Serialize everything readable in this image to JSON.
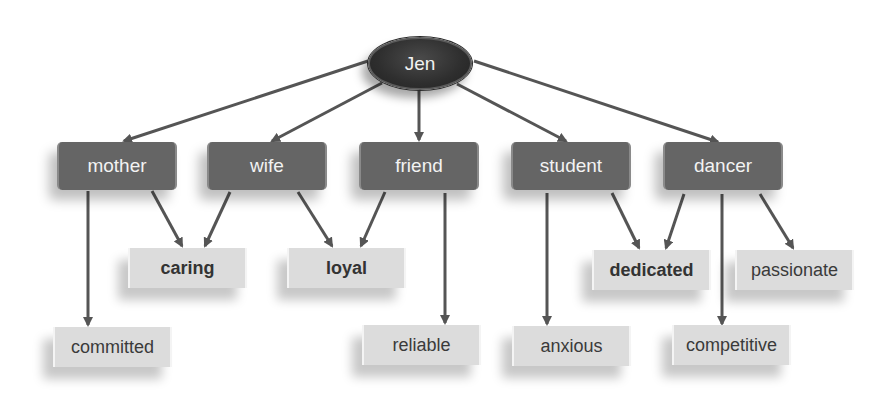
{
  "root": {
    "label": "Jen"
  },
  "roles": [
    {
      "id": "mother",
      "label": "mother"
    },
    {
      "id": "wife",
      "label": "wife"
    },
    {
      "id": "friend",
      "label": "friend"
    },
    {
      "id": "student",
      "label": "student"
    },
    {
      "id": "dancer",
      "label": "dancer"
    }
  ],
  "traits": [
    {
      "id": "caring",
      "label": "caring",
      "bold": true,
      "from": [
        "mother",
        "wife"
      ]
    },
    {
      "id": "loyal",
      "label": "loyal",
      "bold": true,
      "from": [
        "wife",
        "friend"
      ]
    },
    {
      "id": "dedicated",
      "label": "dedicated",
      "bold": true,
      "from": [
        "student",
        "dancer"
      ]
    },
    {
      "id": "passionate",
      "label": "passionate",
      "bold": false,
      "from": [
        "dancer"
      ]
    },
    {
      "id": "committed",
      "label": "committed",
      "bold": false,
      "from": [
        "mother"
      ]
    },
    {
      "id": "reliable",
      "label": "reliable",
      "bold": false,
      "from": [
        "friend"
      ]
    },
    {
      "id": "anxious",
      "label": "anxious",
      "bold": false,
      "from": [
        "student"
      ]
    },
    {
      "id": "competitive",
      "label": "competitive",
      "bold": false,
      "from": [
        "dancer"
      ]
    }
  ],
  "colors": {
    "root_fill": "#2e2e2e",
    "role_fill": "#656565",
    "trait_fill": "#dcdcdc",
    "edge": "#555555"
  }
}
